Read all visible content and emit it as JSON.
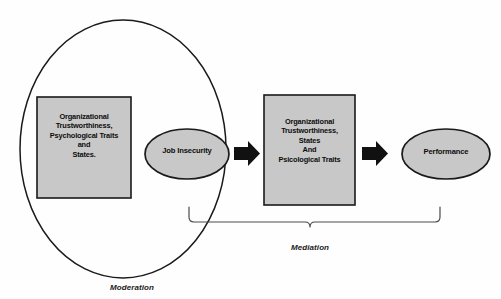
{
  "diagram": {
    "colors": {
      "shape_fill": "#c8c8c8",
      "shape_stroke": "#1a1a1a",
      "arrow_fill": "#111111",
      "background": "#fefefe",
      "text": "#0d0d0d"
    },
    "nodes": {
      "box_left": {
        "shape": "rectangle",
        "lines": [
          "Organizational",
          "Trustworthiness,",
          "Psychological Traits",
          "and",
          "States."
        ]
      },
      "ellipse_job_insecurity": {
        "shape": "ellipse",
        "label": "Job Insecurity"
      },
      "box_middle": {
        "shape": "rectangle",
        "lines": [
          "Organizational",
          "Trustworthiness,",
          "States",
          "And",
          "Psicological Traits"
        ]
      },
      "ellipse_performance": {
        "shape": "ellipse",
        "label": "Performance"
      },
      "moderation_ellipse": {
        "shape": "ellipse-outline",
        "label": ""
      }
    },
    "connectors": {
      "arrow_1": "block-arrow-right",
      "arrow_2": "block-arrow-right"
    },
    "captions": {
      "mediation": "Mediation",
      "moderation": "Moderation"
    }
  }
}
